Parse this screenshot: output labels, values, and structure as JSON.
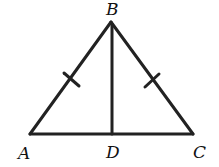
{
  "diagram": {
    "type": "isosceles-triangle-with-altitude",
    "points": {
      "A": {
        "label": "A",
        "x": 30,
        "y": 134
      },
      "B": {
        "label": "B",
        "x": 111,
        "y": 22
      },
      "C": {
        "label": "C",
        "x": 193,
        "y": 134
      },
      "D": {
        "label": "D",
        "x": 112,
        "y": 134
      }
    },
    "segments": [
      "AB",
      "BC",
      "AC",
      "BD"
    ],
    "congruence_marks": [
      "AB",
      "BC"
    ],
    "stroke_color": "#222222"
  }
}
